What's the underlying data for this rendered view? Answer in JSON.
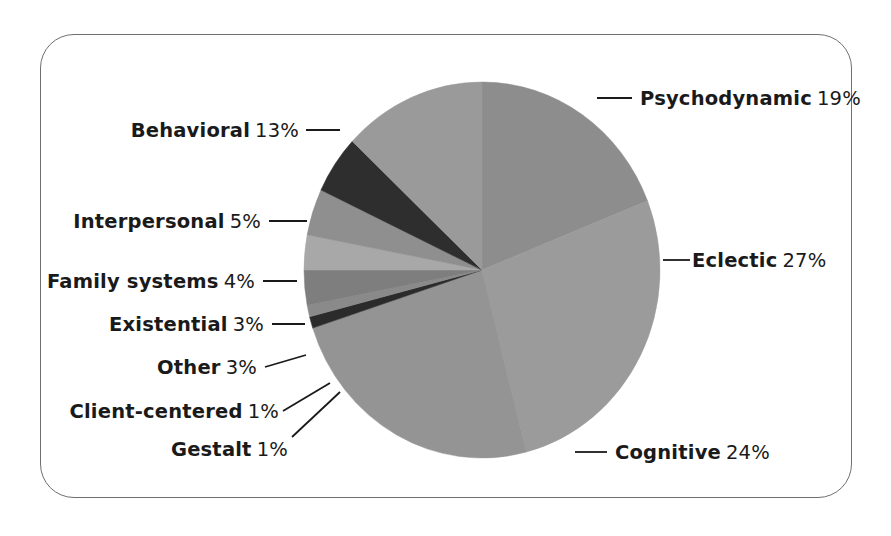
{
  "figure": {
    "border_color": "#6f6f6f",
    "background": "#ffffff"
  },
  "chart_data": {
    "type": "pie",
    "title": "",
    "subtitle": "",
    "xlabel": "",
    "ylabel": "",
    "legend_position": "callout-labels",
    "grid": false,
    "unit": "%",
    "start_angle_deg": -90,
    "direction": "clockwise",
    "center": {
      "x": 482,
      "y": 270
    },
    "radius": {
      "rx": 178,
      "ry": 188
    },
    "categories": [
      "Psychodynamic",
      "Eclectic",
      "Cognitive",
      "Gestalt",
      "Client-centered",
      "Other",
      "Existential",
      "Family systems",
      "Interpersonal",
      "Behavioral"
    ],
    "values": [
      19,
      27,
      24,
      1,
      1,
      3,
      3,
      4,
      5,
      13
    ],
    "colors": [
      "#8d8d8d",
      "#9b9b9b",
      "#949494",
      "#2b2b2b",
      "#8a8a8a",
      "#7e7e7e",
      "#a8a8a8",
      "#8f8f8f",
      "#2e2e2e",
      "#9a9a9a"
    ],
    "slices": [
      {
        "label": "Psychodynamic",
        "value": 19,
        "display": "19%",
        "color": "#8d8d8d"
      },
      {
        "label": "Eclectic",
        "value": 27,
        "display": "27%",
        "color": "#9b9b9b"
      },
      {
        "label": "Cognitive",
        "value": 24,
        "display": "24%",
        "color": "#949494"
      },
      {
        "label": "Gestalt",
        "value": 1,
        "display": "1%",
        "color": "#2b2b2b"
      },
      {
        "label": "Client-centered",
        "value": 1,
        "display": "1%",
        "color": "#8a8a8a"
      },
      {
        "label": "Other",
        "value": 3,
        "display": "3%",
        "color": "#7e7e7e"
      },
      {
        "label": "Existential",
        "value": 3,
        "display": "3%",
        "color": "#a8a8a8"
      },
      {
        "label": "Family systems",
        "value": 4,
        "display": "4%",
        "color": "#8f8f8f"
      },
      {
        "label": "Interpersonal",
        "value": 5,
        "display": "5%",
        "color": "#2e2e2e"
      },
      {
        "label": "Behavioral",
        "value": 13,
        "display": "13%",
        "color": "#9a9a9a"
      }
    ]
  },
  "labels": {
    "psychodynamic": {
      "name": "Psychodynamic",
      "pct": "19%"
    },
    "eclectic": {
      "name": "Eclectic",
      "pct": "27%"
    },
    "cognitive": {
      "name": "Cognitive",
      "pct": "24%"
    },
    "gestalt": {
      "name": "Gestalt",
      "pct": "1%"
    },
    "client_centered": {
      "name": "Client-centered",
      "pct": "1%"
    },
    "other": {
      "name": "Other",
      "pct": "3%"
    },
    "existential": {
      "name": "Existential",
      "pct": "3%"
    },
    "family_systems": {
      "name": "Family systems",
      "pct": "4%"
    },
    "interpersonal": {
      "name": "Interpersonal",
      "pct": "5%"
    },
    "behavioral": {
      "name": "Behavioral",
      "pct": "13%"
    }
  }
}
